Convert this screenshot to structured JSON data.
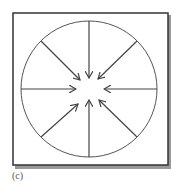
{
  "figure": {
    "label": "(c)",
    "arrow_count": 8,
    "arrow_direction": "inward",
    "colors": {
      "stroke": "#444444",
      "shadow": "#888888",
      "background": "#ffffff"
    }
  }
}
